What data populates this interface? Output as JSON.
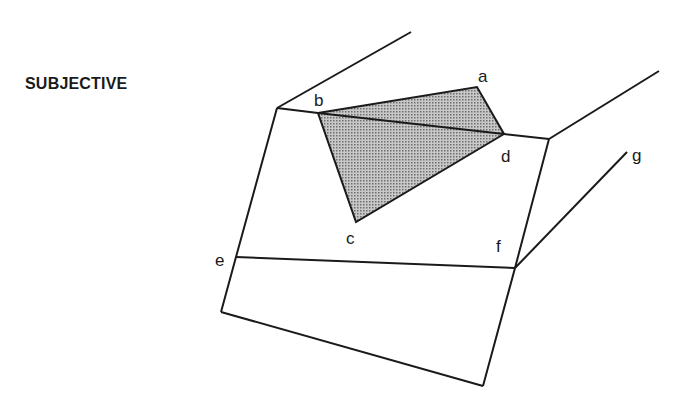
{
  "diagram": {
    "title": "SUBJECTIVE",
    "colors": {
      "line": "#1a1a1a",
      "shade": "#a9a9a9",
      "background": "#ffffff"
    },
    "labels": [
      {
        "id": "a",
        "text": "a",
        "x": 478,
        "y": 82
      },
      {
        "id": "b",
        "text": "b",
        "x": 314,
        "y": 106
      },
      {
        "id": "c",
        "text": "c",
        "x": 346,
        "y": 244
      },
      {
        "id": "d",
        "text": "d",
        "x": 501,
        "y": 162
      },
      {
        "id": "e",
        "text": "e",
        "x": 215,
        "y": 266
      },
      {
        "id": "f",
        "text": "f",
        "x": 496,
        "y": 252
      },
      {
        "id": "g",
        "text": "g",
        "x": 632,
        "y": 161
      }
    ],
    "shaded_region": "quadrilateral b-a-d-c with diagonal b-d"
  }
}
